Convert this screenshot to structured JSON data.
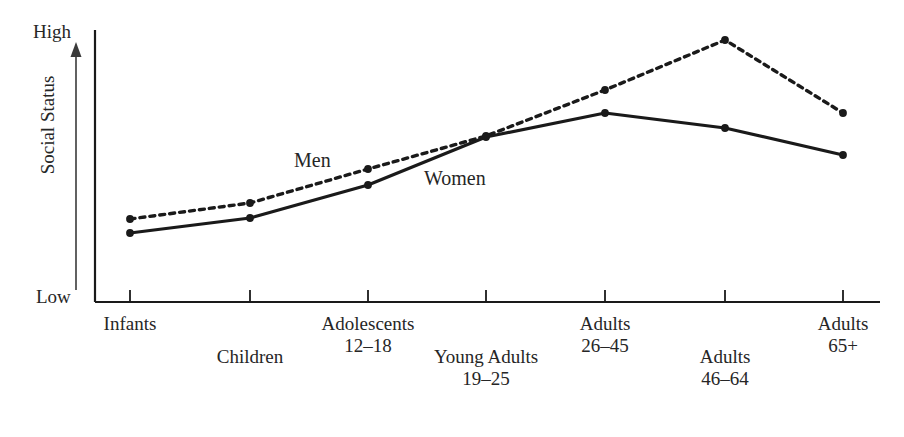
{
  "chart_data": {
    "type": "line",
    "title": "",
    "xlabel": "",
    "ylabel": "Social Status",
    "grid": false,
    "legend_position": "inline-annotation",
    "y_axis": {
      "low_label": "Low",
      "high_label": "High",
      "ticks": [
        "Low",
        "High"
      ],
      "scale": "qualitative"
    },
    "categories": [
      "Infants",
      "Children",
      "Adolescents 12–18",
      "Young Adults 19–25",
      "Adults 26–45",
      "Adults 46–64",
      "Adults 65+"
    ],
    "series": [
      {
        "name": "Men",
        "style": "dashed",
        "marker": "dot",
        "color": "#1a1a1a",
        "values": [
          22,
          28,
          41,
          57,
          74,
          89,
          65
        ]
      },
      {
        "name": "Women",
        "style": "solid",
        "marker": "dot",
        "color": "#1a1a1a",
        "values": [
          17,
          23,
          35,
          56,
          65,
          59,
          49
        ]
      }
    ],
    "annotations": [
      {
        "text": "Men",
        "x": 294,
        "y": 150
      },
      {
        "text": "Women",
        "x": 424,
        "y": 168
      }
    ]
  },
  "axes": {
    "y_high": "High",
    "y_low": "Low",
    "y_title": "Social Status",
    "arrow_direction": "up"
  },
  "x_axis_labels": [
    {
      "line1": "Infants",
      "line2": "",
      "row": "top",
      "center": 130
    },
    {
      "line1": "Children",
      "line2": "",
      "row": "bottom",
      "center": 250
    },
    {
      "line1": "Adolescents",
      "line2": "12–18",
      "row": "top",
      "center": 368
    },
    {
      "line1": "Young Adults",
      "line2": "19–25",
      "row": "bottom",
      "center": 486
    },
    {
      "line1": "Adults",
      "line2": "26–45",
      "row": "top",
      "center": 605
    },
    {
      "line1": "Adults",
      "line2": "46–64",
      "row": "bottom",
      "center": 725
    },
    {
      "line1": "Adults",
      "line2": "65+",
      "row": "top",
      "center": 843
    }
  ],
  "series_labels": {
    "men": "Men",
    "women": "Women"
  },
  "colors": {
    "ink": "#1a1a1a",
    "text": "#262626",
    "background": "#ffffff"
  }
}
